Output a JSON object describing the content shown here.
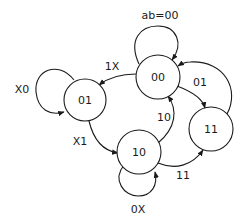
{
  "diagram": {
    "type": "state-diagram",
    "input_label": "ab=00",
    "states": [
      {
        "id": "00",
        "label": "00"
      },
      {
        "id": "01",
        "label": "01"
      },
      {
        "id": "10",
        "label": "10"
      },
      {
        "id": "11",
        "label": "11"
      }
    ],
    "transitions": [
      {
        "from": "00",
        "to": "00",
        "label": "ab=00"
      },
      {
        "from": "00",
        "to": "01",
        "label": "1X"
      },
      {
        "from": "00",
        "to": "11",
        "label": "01"
      },
      {
        "from": "01",
        "to": "01",
        "label": "X0"
      },
      {
        "from": "01",
        "to": "10",
        "label": "X1"
      },
      {
        "from": "10",
        "to": "10",
        "label": "0X"
      },
      {
        "from": "10",
        "to": "00",
        "label": "10"
      },
      {
        "from": "10",
        "to": "11",
        "label": "11"
      },
      {
        "from": "11",
        "to": "00",
        "label": ""
      }
    ]
  }
}
